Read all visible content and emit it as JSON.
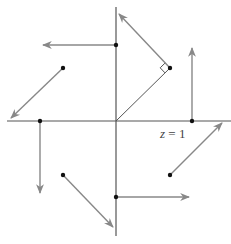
{
  "diagram": {
    "type": "vector-field",
    "origin": [
      116,
      121
    ],
    "axes": {
      "x": {
        "from": [
          7,
          121
        ],
        "to": [
          231,
          121
        ]
      },
      "y": {
        "from": [
          116,
          7
        ],
        "to": [
          116,
          236
        ]
      }
    },
    "colors": {
      "axis": "#555555",
      "arrow": "#888888",
      "point": "#111111",
      "label": "#444444"
    },
    "vectors": [
      {
        "id": "v1",
        "start": [
          116,
          45
        ],
        "end": [
          43,
          45
        ]
      },
      {
        "id": "v2",
        "start": [
          170,
          68
        ],
        "end": [
          119,
          14
        ]
      },
      {
        "id": "v3",
        "start": [
          63,
          68
        ],
        "end": [
          11,
          118
        ]
      },
      {
        "id": "v4",
        "start": [
          192,
          121
        ],
        "end": [
          192,
          48
        ]
      },
      {
        "id": "v5",
        "start": [
          40,
          121
        ],
        "end": [
          40,
          193
        ]
      },
      {
        "id": "v6",
        "start": [
          63,
          175
        ],
        "end": [
          113,
          227
        ]
      },
      {
        "id": "v7",
        "start": [
          116,
          197
        ],
        "end": [
          189,
          197
        ]
      },
      {
        "id": "v8",
        "start": [
          170,
          175
        ],
        "end": [
          222,
          123
        ]
      }
    ],
    "radius_line": {
      "from": [
        116,
        121
      ],
      "to": [
        170,
        68
      ]
    },
    "right_angle_marker": true,
    "label": {
      "var": "z",
      "eq": " = 1",
      "text": "z = 1",
      "position": [
        160,
        126
      ]
    }
  }
}
